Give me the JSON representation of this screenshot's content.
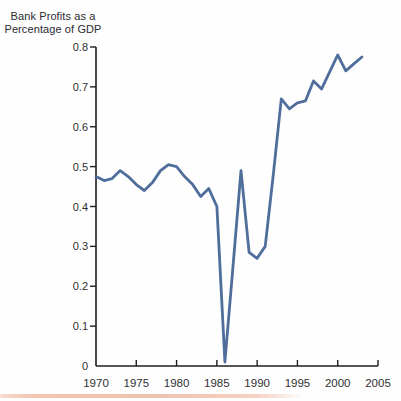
{
  "title": {
    "line1": "Bank Profits as a",
    "line2": "Percentage of GDP"
  },
  "colors": {
    "line": "#4f6e9b",
    "axis": "#1f1f22",
    "tick_text": "#2e2e31",
    "title_text": "#2a2a31",
    "background": "#fefefe",
    "scan_artifact": "#eebea8"
  },
  "chart_data": {
    "type": "line",
    "title": "Bank Profits as a Percentage of GDP",
    "xlabel": "",
    "ylabel": "Bank Profits as a Percentage of GDP",
    "x": [
      1970,
      1971,
      1972,
      1973,
      1974,
      1975,
      1976,
      1977,
      1978,
      1979,
      1980,
      1981,
      1982,
      1983,
      1984,
      1985,
      1986,
      1987,
      1988,
      1989,
      1990,
      1991,
      1992,
      1993,
      1994,
      1995,
      1996,
      1997,
      1998,
      1999,
      2000,
      2001,
      2002,
      2003
    ],
    "values": [
      0.475,
      0.465,
      0.47,
      0.49,
      0.475,
      0.455,
      0.44,
      0.46,
      0.49,
      0.505,
      0.5,
      0.475,
      0.455,
      0.425,
      0.445,
      0.4,
      0.01,
      0.25,
      0.49,
      0.285,
      0.27,
      0.3,
      0.48,
      0.67,
      0.645,
      0.66,
      0.665,
      0.715,
      0.695,
      0.7375,
      0.78,
      0.74,
      0.7575,
      0.775
    ],
    "xlim": [
      1970,
      2005
    ],
    "ylim": [
      0,
      0.8
    ],
    "x_tick_labels": [
      "1970",
      "1975",
      "1980",
      "1985",
      "1990",
      "1995",
      "2000",
      "2005"
    ],
    "x_tick_values": [
      1970,
      1975,
      1980,
      1985,
      1990,
      1995,
      2000,
      2005
    ],
    "y_tick_labels": [
      "0",
      "0.1",
      "0.2",
      "0.3",
      "0.4",
      "0.5",
      "0.6",
      "0.7",
      "0.8"
    ],
    "y_tick_values": [
      0,
      0.1,
      0.2,
      0.3,
      0.4,
      0.5,
      0.6,
      0.7,
      0.8
    ],
    "grid": false,
    "legend": "none"
  }
}
